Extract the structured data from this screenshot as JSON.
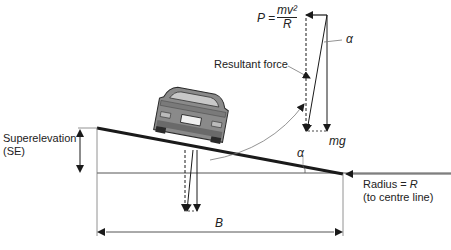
{
  "labels": {
    "formula_lhs": "P =",
    "formula_num": "mv²",
    "formula_den": "R",
    "alpha_top": "α",
    "resultant": "Resultant force",
    "mg": "mg",
    "alpha_bottom": "α",
    "superelevation_line1": "Superelevation",
    "superelevation_line2": "(SE)",
    "radius_line1": "Radius = R",
    "radius_line2": "(to centre line)",
    "b": "B"
  },
  "colors": {
    "line": "#1a1a1a",
    "thin": "#555555",
    "car_body": "#8a8a8a",
    "car_dark": "#3a3a3a"
  }
}
